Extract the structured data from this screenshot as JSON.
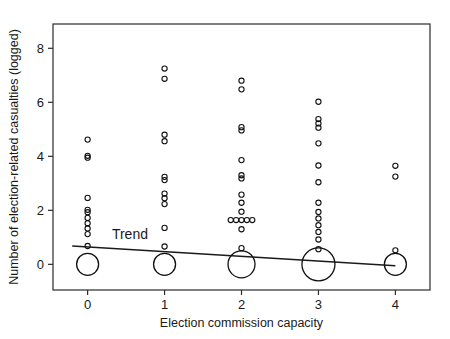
{
  "chart_data": {
    "type": "scatter",
    "title": "",
    "xlabel": "Election commission capacity",
    "ylabel": "Number of election-related casualties (logged)",
    "xlim": [
      -0.45,
      4.45
    ],
    "ylim": [
      -0.95,
      8.9
    ],
    "xticks": [
      0,
      1,
      2,
      3,
      4
    ],
    "xtick_labels": [
      "0",
      "1",
      "2",
      "3",
      "4"
    ],
    "yticks": [
      0,
      2,
      4,
      6,
      8
    ],
    "ytick_labels": [
      "0",
      "2",
      "4",
      "6",
      "8"
    ],
    "grid": false,
    "legend": "none",
    "annotations": [
      {
        "text": "Trend",
        "x": 0.55,
        "y": 0.95
      }
    ],
    "series": [
      {
        "name": "Observations",
        "marker": "open-circle",
        "points": [
          {
            "x": 0,
            "y": 4.62
          },
          {
            "x": 0,
            "y": 4.02
          },
          {
            "x": 0,
            "y": 3.95
          },
          {
            "x": 0,
            "y": 2.46
          },
          {
            "x": 0,
            "y": 2.02
          },
          {
            "x": 0,
            "y": 1.93
          },
          {
            "x": 0,
            "y": 1.72
          },
          {
            "x": 0,
            "y": 1.52
          },
          {
            "x": 0,
            "y": 1.33
          },
          {
            "x": 0,
            "y": 1.12
          },
          {
            "x": 0,
            "y": 0.68
          },
          {
            "x": 1,
            "y": 7.25
          },
          {
            "x": 1,
            "y": 6.87
          },
          {
            "x": 1,
            "y": 4.8
          },
          {
            "x": 1,
            "y": 4.56
          },
          {
            "x": 1,
            "y": 3.24
          },
          {
            "x": 1,
            "y": 3.12
          },
          {
            "x": 1,
            "y": 2.62
          },
          {
            "x": 1,
            "y": 2.45
          },
          {
            "x": 1,
            "y": 2.23
          },
          {
            "x": 1,
            "y": 1.35
          },
          {
            "x": 1,
            "y": 0.66
          },
          {
            "x": 2,
            "y": 6.8
          },
          {
            "x": 2,
            "y": 6.48
          },
          {
            "x": 2,
            "y": 5.08
          },
          {
            "x": 2,
            "y": 4.96
          },
          {
            "x": 2,
            "y": 3.86
          },
          {
            "x": 2,
            "y": 3.3
          },
          {
            "x": 2,
            "y": 3.18
          },
          {
            "x": 2,
            "y": 2.58
          },
          {
            "x": 2,
            "y": 2.28
          },
          {
            "x": 2,
            "y": 1.95
          },
          {
            "x": 2,
            "y": 1.64
          },
          {
            "x": 2,
            "y": 1.3
          },
          {
            "x": 2,
            "y": 0.6
          },
          {
            "x": 1.86,
            "y": 1.64
          },
          {
            "x": 1.93,
            "y": 1.64
          },
          {
            "x": 2.07,
            "y": 1.64
          },
          {
            "x": 2.14,
            "y": 1.64
          },
          {
            "x": 3,
            "y": 6.02
          },
          {
            "x": 3,
            "y": 5.38
          },
          {
            "x": 3,
            "y": 5.22
          },
          {
            "x": 3,
            "y": 5.06
          },
          {
            "x": 3,
            "y": 4.48
          },
          {
            "x": 3,
            "y": 3.66
          },
          {
            "x": 3,
            "y": 3.04
          },
          {
            "x": 3,
            "y": 2.28
          },
          {
            "x": 3,
            "y": 1.94
          },
          {
            "x": 3,
            "y": 1.7
          },
          {
            "x": 3,
            "y": 1.45
          },
          {
            "x": 3,
            "y": 1.2
          },
          {
            "x": 3,
            "y": 0.92
          },
          {
            "x": 3,
            "y": 0.56
          },
          {
            "x": 4,
            "y": 3.65
          },
          {
            "x": 4,
            "y": 3.25
          },
          {
            "x": 4,
            "y": 0.52
          }
        ]
      },
      {
        "name": "Zero-count bubbles",
        "marker": "open-circle-large",
        "points": [
          {
            "x": 0,
            "y": 0,
            "size": 22
          },
          {
            "x": 1,
            "y": 0,
            "size": 22
          },
          {
            "x": 2,
            "y": 0,
            "size": 27
          },
          {
            "x": 3,
            "y": 0,
            "size": 33
          },
          {
            "x": 4,
            "y": 0,
            "size": 22
          }
        ]
      }
    ],
    "trend": {
      "name": "Trend",
      "x": [
        -0.2,
        4.0
      ],
      "y": [
        0.68,
        -0.05
      ]
    }
  }
}
